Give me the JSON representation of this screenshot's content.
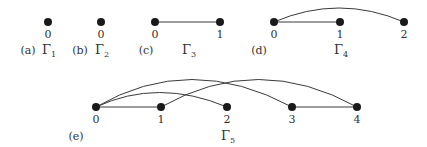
{
  "figure": {
    "graphs": [
      {
        "id": "a",
        "part_label": "(a)",
        "name": "Γ",
        "subscript": "1",
        "nodes": [
          {
            "label": "0"
          }
        ],
        "edges": []
      },
      {
        "id": "b",
        "part_label": "(b)",
        "name": "Γ",
        "subscript": "2",
        "nodes": [
          {
            "label": "0"
          }
        ],
        "edges": []
      },
      {
        "id": "c",
        "part_label": "(c)",
        "name": "Γ",
        "subscript": "3",
        "nodes": [
          {
            "label": "0"
          },
          {
            "label": "1"
          }
        ],
        "edges": [
          [
            "0",
            "1"
          ]
        ]
      },
      {
        "id": "d",
        "part_label": "(d)",
        "name": "Γ",
        "subscript": "4",
        "nodes": [
          {
            "label": "0"
          },
          {
            "label": "1"
          },
          {
            "label": "2"
          }
        ],
        "edges": [
          [
            "0",
            "1"
          ],
          [
            "0",
            "2"
          ]
        ]
      },
      {
        "id": "e",
        "part_label": "(e)",
        "name": "Γ",
        "subscript": "5",
        "nodes": [
          {
            "label": "0"
          },
          {
            "label": "1"
          },
          {
            "label": "2"
          },
          {
            "label": "3"
          },
          {
            "label": "4"
          }
        ],
        "edges": [
          [
            "0",
            "1"
          ],
          [
            "0",
            "2"
          ],
          [
            "0",
            "3"
          ],
          [
            "1",
            "4"
          ],
          [
            "3",
            "4"
          ]
        ]
      }
    ],
    "colors": {
      "node": "#1a1a1a",
      "edge": "#3a3a3a",
      "text": "#333333",
      "background": "#ffffff"
    }
  }
}
